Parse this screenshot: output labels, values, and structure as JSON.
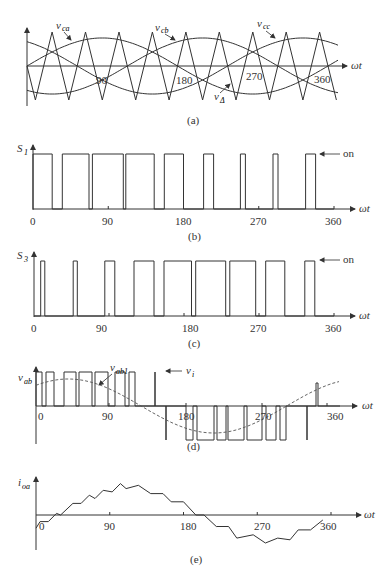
{
  "figure": {
    "panels": [
      {
        "id": "a",
        "caption": "(a)",
        "x_label": "ωt",
        "ticks": [
          "90",
          "180",
          "270",
          "360"
        ],
        "signals": [
          "v_ca",
          "v_cb",
          "v_cc",
          "v_Δ"
        ]
      },
      {
        "id": "b",
        "caption": "(b)",
        "y_label": "S1",
        "x_label": "ωt",
        "annotation": "on",
        "ticks": [
          "0",
          "90",
          "180",
          "270",
          "360"
        ]
      },
      {
        "id": "c",
        "caption": "(c)",
        "y_label": "S3",
        "x_label": "ωt",
        "annotation": "on",
        "ticks": [
          "0",
          "90",
          "180",
          "270",
          "360"
        ]
      },
      {
        "id": "d",
        "caption": "(d)",
        "y_label": "v_ab",
        "x_label": "ωt",
        "annotations": [
          "v_ab1",
          "v_i"
        ],
        "ticks": [
          "0",
          "90",
          "180",
          "270",
          "360"
        ]
      },
      {
        "id": "e",
        "caption": "(e)",
        "y_label": "i_oa",
        "x_label": "ωt",
        "ticks": [
          "0",
          "90",
          "180",
          "270",
          "360"
        ]
      }
    ]
  },
  "labels": {
    "a": {
      "vca": "v",
      "vca_sub": "ca",
      "vcb": "v",
      "vcb_sub": "cb",
      "vcc": "v",
      "vcc_sub": "cc",
      "vtri": "v",
      "vtri_sub": "Δ",
      "wt": "ωt",
      "t90": "90",
      "t180": "180",
      "t270": "270",
      "t360": "360",
      "cap": "(a)"
    },
    "b": {
      "y": "S",
      "y_sub": "1",
      "on": "on",
      "wt": "ωt",
      "t0": "0",
      "t90": "90",
      "t180": "180",
      "t270": "270",
      "t360": "360",
      "cap": "(b)"
    },
    "c": {
      "y": "S",
      "y_sub": "3",
      "on": "on",
      "wt": "ωt",
      "t0": "0",
      "t90": "90",
      "t180": "180",
      "t270": "270",
      "t360": "360",
      "cap": "(c)"
    },
    "d": {
      "y": "v",
      "y_sub": "ab",
      "vab1": "v",
      "vab1_sub": "ab1",
      "vi": "v",
      "vi_sub": "i",
      "wt": "ωt",
      "t0": "0",
      "t90": "90",
      "t180": "180",
      "t270": "270",
      "t360": "360",
      "cap": "(d)"
    },
    "e": {
      "y": "i",
      "y_sub": "oa",
      "wt": "ωt",
      "t0": "0",
      "t90": "90",
      "t180": "180",
      "t270": "270",
      "t360": "360",
      "cap": "(e)"
    }
  },
  "chart_data": [
    {
      "type": "line",
      "title": "(a) Carrier and reference signals",
      "xlabel": "ωt (deg)",
      "ylabel": "",
      "x_ticks": [
        90,
        180,
        270,
        360
      ],
      "series": [
        {
          "name": "v_ca",
          "kind": "sine",
          "amplitude": 0.85,
          "phase_deg": 0
        },
        {
          "name": "v_cb",
          "kind": "sine",
          "amplitude": 0.85,
          "phase_deg": -120
        },
        {
          "name": "v_cc",
          "kind": "sine",
          "amplitude": 0.85,
          "phase_deg": 120
        },
        {
          "name": "v_Δ",
          "kind": "triangle",
          "amplitude": 1.0,
          "cycles_per_360": 9
        }
      ]
    },
    {
      "type": "line",
      "title": "(b) Switch S1 state",
      "xlabel": "ωt (deg)",
      "ylabel": "S1",
      "x_ticks": [
        0,
        90,
        180,
        270,
        360
      ],
      "on_intervals_deg": [
        [
          0,
          23
        ],
        [
          35,
          67
        ],
        [
          71,
          108
        ],
        [
          111,
          145
        ],
        [
          157,
          180
        ],
        [
          204,
          216
        ],
        [
          248,
          254
        ],
        [
          287,
          293
        ],
        [
          326,
          338
        ]
      ]
    },
    {
      "type": "line",
      "title": "(c) Switch S3 state",
      "xlabel": "ωt (deg)",
      "ylabel": "S3",
      "x_ticks": [
        0,
        90,
        180,
        270,
        360
      ],
      "on_intervals_deg": [
        [
          8,
          13
        ],
        [
          47,
          52
        ],
        [
          85,
          97
        ],
        [
          120,
          144
        ],
        [
          156,
          189
        ],
        [
          194,
          230
        ],
        [
          235,
          266
        ],
        [
          278,
          301
        ],
        [
          325,
          337
        ]
      ]
    },
    {
      "type": "line",
      "title": "(d) Line voltage v_ab with fundamental v_ab1",
      "xlabel": "ωt (deg)",
      "ylabel": "v_ab",
      "x_ticks": [
        0,
        90,
        180,
        270,
        360
      ],
      "series": [
        {
          "name": "v_ab",
          "kind": "pwm",
          "levels": [
            -1,
            0,
            1
          ]
        },
        {
          "name": "v_ab1",
          "kind": "sine_dashed",
          "amplitude": 0.65,
          "phase_deg": 30
        }
      ]
    },
    {
      "type": "line",
      "title": "(e) Output current i_oa",
      "xlabel": "ωt (deg)",
      "ylabel": "i_oa",
      "x_ticks": [
        0,
        90,
        180,
        270,
        360
      ],
      "x": [
        0,
        5,
        15,
        25,
        30,
        45,
        55,
        65,
        72,
        82,
        93,
        103,
        110,
        125,
        140,
        155,
        165,
        180,
        195,
        205,
        220,
        235,
        245,
        265,
        280,
        295,
        310,
        320,
        335,
        350,
        360,
        372
      ],
      "values": [
        -0.4,
        -0.2,
        -0.2,
        0.05,
        0.0,
        0.35,
        0.35,
        0.6,
        0.5,
        0.75,
        0.7,
        0.95,
        0.8,
        0.9,
        0.65,
        0.65,
        0.4,
        0.4,
        0.0,
        0.0,
        -0.35,
        -0.35,
        -0.7,
        -0.6,
        -0.85,
        -0.7,
        -0.75,
        -0.45,
        -0.45,
        -0.15
      ]
    }
  ]
}
